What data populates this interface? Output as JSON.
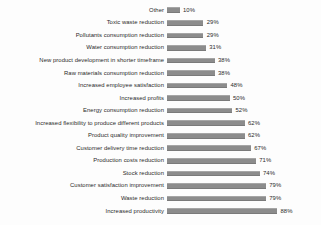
{
  "chart_data": {
    "type": "bar",
    "orientation": "horizontal",
    "title": "",
    "xlabel": "",
    "ylabel": "",
    "xlim": [
      0,
      100
    ],
    "grid": false,
    "legend": "none",
    "value_suffix": "%",
    "bar_color": "#8c8c8c",
    "background_color": "#fdfdfd",
    "text_color": "#2a2a2a",
    "categories": [
      "Other",
      "Toxic waste reduction",
      "Pollutants consumption reduction",
      "Water consumption reduction",
      "New product development in shorter timeframe",
      "Raw materials consumption reduction",
      "Increased employee satisfaction",
      "Increased profits",
      "Energy consumption reduction",
      "Increased flexibility to produce different products",
      "Product quality improvement",
      "Customer delivery time reduction",
      "Production costs reduction",
      "Stock reduction",
      "Customer satisfaction improvement",
      "Waste reduction",
      "Increased productivity"
    ],
    "values": [
      10,
      29,
      29,
      31,
      38,
      38,
      48,
      50,
      52,
      62,
      62,
      67,
      71,
      74,
      79,
      79,
      88
    ],
    "value_labels": [
      "10%",
      "29%",
      "29%",
      "31%",
      "38%",
      "38%",
      "48%",
      "50%",
      "52%",
      "62%",
      "62%",
      "67%",
      "71%",
      "74%",
      "79%",
      "79%",
      "88%"
    ]
  }
}
